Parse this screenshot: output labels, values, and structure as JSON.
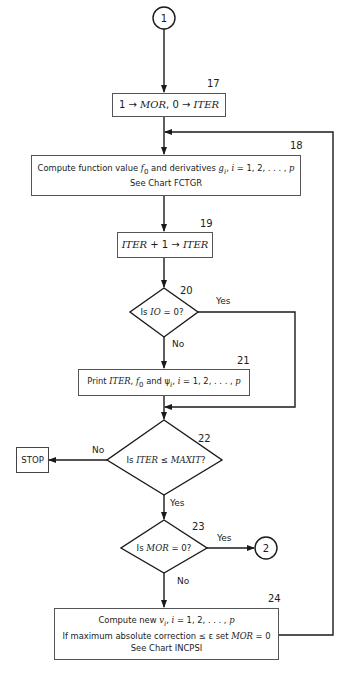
{
  "connectors": {
    "start": "1",
    "end": "2"
  },
  "steps": {
    "s17": {
      "number": "17",
      "line1_a": "1 → ",
      "line1_b": "MOR",
      "line1_c": ", 0 → ",
      "line1_d": "ITER"
    },
    "s18": {
      "number": "18",
      "line1_a": "Compute function value ",
      "line1_b": "f",
      "line1_sub": "0",
      "line1_c": " and derivatives ",
      "line1_d": "g",
      "line1_sub2": "i",
      "line1_e": ", ",
      "line1_f": "i",
      "line1_g": " = 1, 2, . . . , ",
      "line1_h": "p",
      "line2": "See Chart FCTGR"
    },
    "s19": {
      "number": "19",
      "text_a": "ITER",
      "text_b": " + 1 → ",
      "text_c": "ITER"
    },
    "s20": {
      "number": "20",
      "text_a": "Is ",
      "text_b": "IO",
      "text_c": " = 0?",
      "yes": "Yes",
      "no": "No"
    },
    "s21": {
      "number": "21",
      "text_a": "Print ",
      "text_b": "ITER",
      "text_c": ", ",
      "text_d": "f",
      "text_sub": "0",
      "text_e": " and ψ",
      "text_sub2": "i",
      "text_f": ", ",
      "text_g": "i",
      "text_h": " = 1, 2, . . . , ",
      "text_i": "p"
    },
    "s22": {
      "number": "22",
      "text_a": "Is ",
      "text_b": "ITER",
      "text_c": " ≤ ",
      "text_d": "MAXIT",
      "text_e": "?",
      "yes": "Yes",
      "no": "No"
    },
    "stop": {
      "label": "STOP"
    },
    "s23": {
      "number": "23",
      "text_a": "Is ",
      "text_b": "MOR",
      "text_c": " = 0?",
      "yes": "Yes",
      "no": "No"
    },
    "s24": {
      "number": "24",
      "line1_a": "Compute new ",
      "line1_b": "v",
      "line1_sub": "i",
      "line1_c": ", ",
      "line1_d": "i",
      "line1_e": " = 1, 2, . . . , ",
      "line1_f": "p",
      "line2_a": "If maximum absolute correction ≤ ε set ",
      "line2_b": "MOR",
      "line2_c": " = 0",
      "line3": "See Chart INCPSI"
    }
  }
}
